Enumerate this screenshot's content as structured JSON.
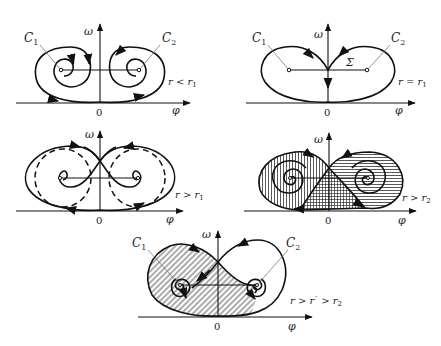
{
  "figure": {
    "axes": {
      "x_label": "φ",
      "y_label": "ω",
      "origin_label": "0"
    },
    "points": {
      "c1": "C",
      "c1_sub": "1",
      "c2": "C",
      "c2_sub": "2",
      "separatrix": "Σ"
    },
    "panels": [
      {
        "id": "p1",
        "condition": "r < r",
        "condition_sub": "1",
        "has_C_labels": true,
        "description": "Two spiral foci C1, C2 with trajectories winding inward"
      },
      {
        "id": "p2",
        "condition": "r = r",
        "condition_sub": "1",
        "has_C_labels": true,
        "has_sigma": true,
        "description": "Homoclinic loop Σ through the saddle"
      },
      {
        "id": "p3",
        "condition": "r > r",
        "condition_sub": "1",
        "has_C_labels": false,
        "description": "Figure-eight separatrix with dashed unstable limit cycles"
      },
      {
        "id": "p4",
        "condition": "r > r",
        "condition_sub": "2",
        "has_C_labels": false,
        "description": "Hatched basins of attraction (vertical, horizontal, cross-hatched)"
      },
      {
        "id": "p5",
        "condition": "r > r",
        "condition_sup": "⁻",
        "condition_mid": " > r",
        "condition_sub": "2",
        "has_C_labels": true,
        "description": "Diagonally hatched basin around C1"
      }
    ]
  }
}
